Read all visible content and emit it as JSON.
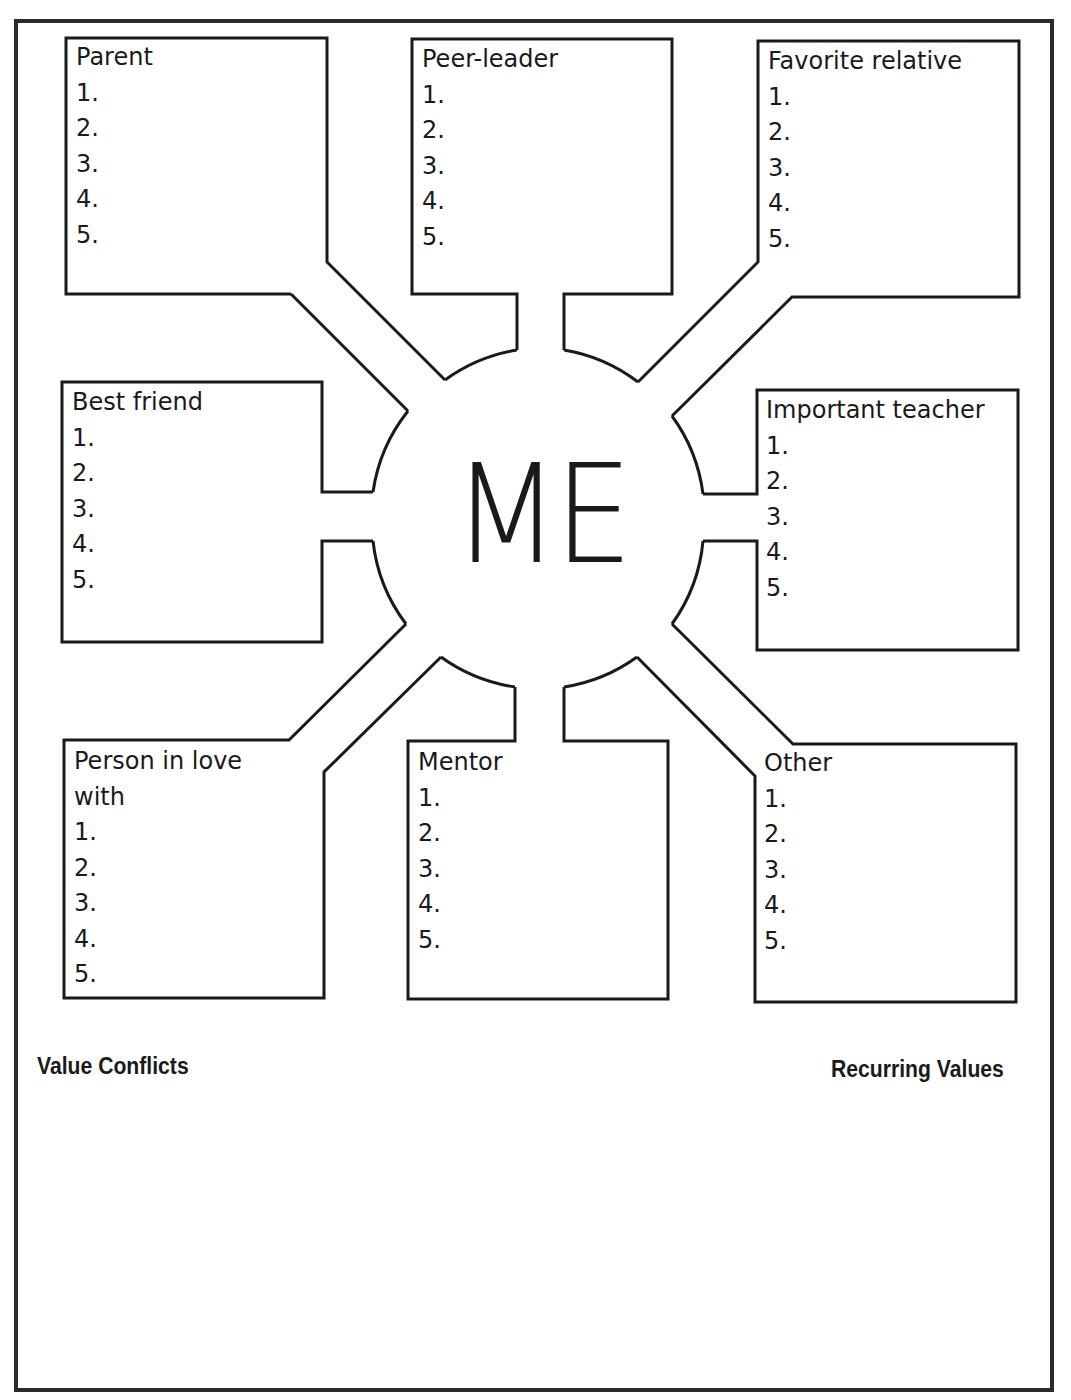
{
  "center": {
    "label": "ME"
  },
  "boxes": [
    {
      "id": "parent",
      "title": "Parent",
      "items": [
        "1.",
        "2.",
        "3.",
        "4.",
        "5."
      ]
    },
    {
      "id": "peer-leader",
      "title": "Peer-leader",
      "items": [
        "1.",
        "2.",
        "3.",
        "4.",
        "5."
      ]
    },
    {
      "id": "favorite-relative",
      "title": "Favorite relative",
      "items": [
        "1.",
        "2.",
        "3.",
        "4.",
        "5."
      ]
    },
    {
      "id": "best-friend",
      "title": "Best friend",
      "items": [
        "1.",
        "2.",
        "3.",
        "4.",
        "5."
      ]
    },
    {
      "id": "important-teacher",
      "title": "Important teacher",
      "items": [
        "1.",
        "2.",
        "3.",
        "4.",
        "5."
      ]
    },
    {
      "id": "person-in-love-with",
      "title": "Person in love\nwith",
      "items": [
        "1.",
        "2.",
        "3.",
        "4.",
        "5."
      ]
    },
    {
      "id": "mentor",
      "title": "Mentor",
      "items": [
        "1.",
        "2.",
        "3.",
        "4.",
        "5."
      ]
    },
    {
      "id": "other",
      "title": "Other",
      "items": [
        "1.",
        "2.",
        "3.",
        "4.",
        "5."
      ]
    }
  ],
  "sections": {
    "left": "Value Conflicts",
    "right": "Recurring Values"
  },
  "colors": {
    "stroke": "#1a1a1a",
    "background": "#ffffff"
  }
}
